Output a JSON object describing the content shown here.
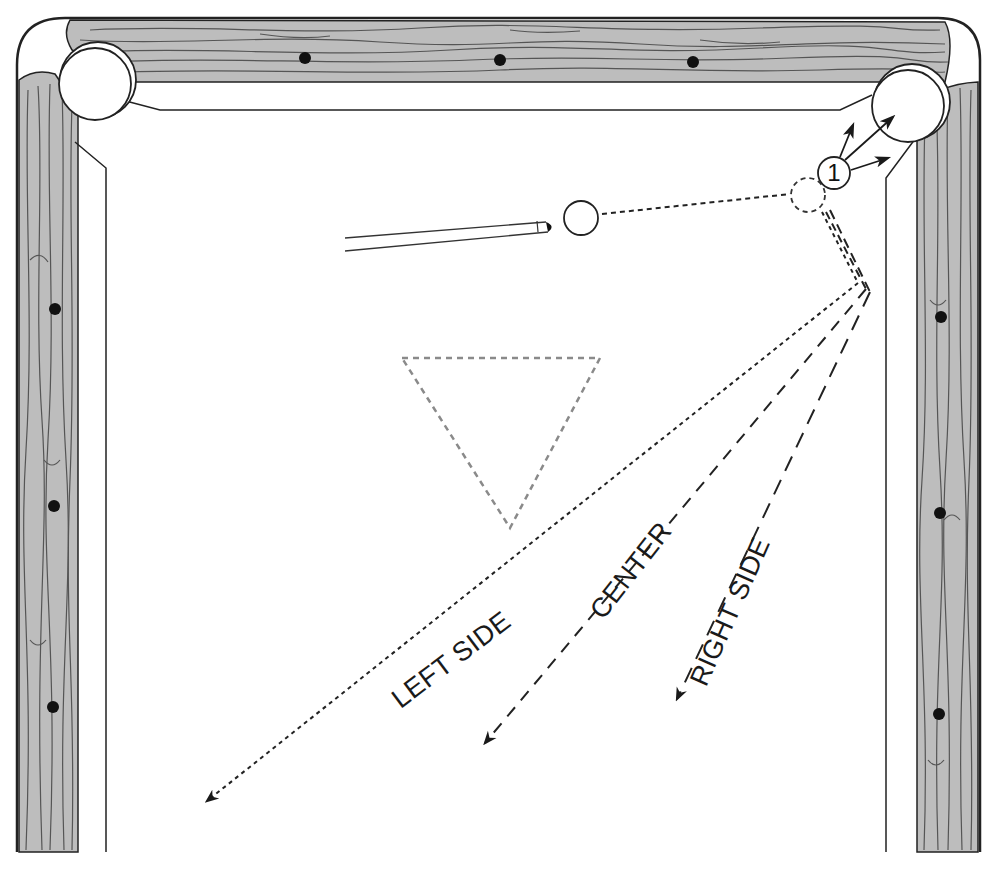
{
  "diagram": {
    "colors": {
      "rail_wood": "#bdbdbd",
      "grain": "#555555",
      "outline": "#222222",
      "felt": "#ffffff",
      "rack_outline": "#8a8a8a",
      "diamond": "#111111"
    },
    "balls": {
      "object_ball": {
        "label": "1"
      },
      "cue_ball": {
        "label": ""
      },
      "ghost_ball": {
        "label": ""
      }
    },
    "paths": [
      {
        "id": "left",
        "label": "LEFT SIDE",
        "style": "fine-dotted"
      },
      {
        "id": "center",
        "label": "CENTER",
        "style": "dashed"
      },
      {
        "id": "right",
        "label": "RIGHT SIDE",
        "style": "long-dashed"
      }
    ],
    "rails": {
      "top_diamonds": 3,
      "left_diamonds": 3,
      "right_diamonds": 3
    },
    "pockets": [
      "top-left-corner-pocket",
      "top-right-corner-pocket"
    ],
    "rack": {
      "shape": "triangle",
      "style": "dashed-gray"
    }
  }
}
